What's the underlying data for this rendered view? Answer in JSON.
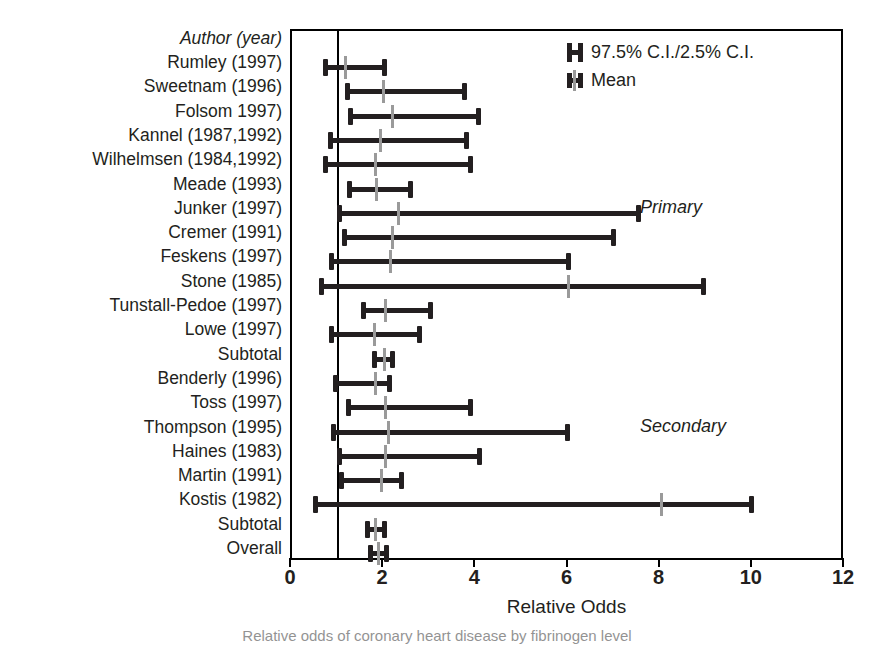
{
  "chart_data": {
    "type": "bar",
    "subtype": "forest-plot",
    "title": "",
    "xlabel": "Relative Odds",
    "ylabel": "",
    "xlim": [
      0,
      12
    ],
    "xticks": [
      0,
      2,
      4,
      6,
      8,
      10,
      12
    ],
    "grid": false,
    "reference_line": 1,
    "column_header": "Author (year)",
    "legend": {
      "position": "top-right",
      "entries": [
        {
          "glyph": "ci-ibar-icon",
          "label": "97.5% C.I./2.5% C.I."
        },
        {
          "glyph": "mean-ibar-icon",
          "label": "Mean"
        }
      ]
    },
    "section_notes": [
      {
        "label": "Primary",
        "row_index": 6
      },
      {
        "label": "Secondary",
        "row_index": 15
      }
    ],
    "rows": [
      {
        "label": "Rumley (1997)",
        "low": 0.71,
        "mean": 1.14,
        "high": 2.02,
        "kind": "study"
      },
      {
        "label": "Sweetnam (1996)",
        "low": 1.19,
        "mean": 1.97,
        "high": 3.75,
        "kind": "study"
      },
      {
        "label": "Folsom 1997)",
        "low": 1.25,
        "mean": 2.18,
        "high": 4.05,
        "kind": "study"
      },
      {
        "label": "Kannel (1987,1992)",
        "low": 0.82,
        "mean": 1.91,
        "high": 3.79,
        "kind": "study"
      },
      {
        "label": "Wilhelmsen (1984,1992)",
        "low": 0.72,
        "mean": 1.8,
        "high": 3.88,
        "kind": "study"
      },
      {
        "label": "Meade (1993)",
        "low": 1.23,
        "mean": 1.82,
        "high": 2.59,
        "kind": "study"
      },
      {
        "label": "Junker (1997)",
        "low": 1.03,
        "mean": 2.3,
        "high": 7.52,
        "kind": "study"
      },
      {
        "label": "Cremer (1991)",
        "low": 1.12,
        "mean": 2.18,
        "high": 6.98,
        "kind": "study"
      },
      {
        "label": "Feskens (1997)",
        "low": 0.85,
        "mean": 2.12,
        "high": 6.0,
        "kind": "study"
      },
      {
        "label": "Stone (1985)",
        "low": 0.63,
        "mean": 5.99,
        "high": 8.93,
        "kind": "study"
      },
      {
        "label": "Tunstall-Pedoe (1997)",
        "low": 1.53,
        "mean": 2.02,
        "high": 3.02,
        "kind": "study"
      },
      {
        "label": "Lowe (1997)",
        "low": 0.85,
        "mean": 1.79,
        "high": 2.78,
        "kind": "study"
      },
      {
        "label": "Subtotal",
        "low": 1.79,
        "mean": 1.99,
        "high": 2.19,
        "kind": "summary"
      },
      {
        "label": "Benderly (1996)",
        "low": 0.93,
        "mean": 1.8,
        "high": 2.13,
        "kind": "study"
      },
      {
        "label": "Toss (1997)",
        "low": 1.21,
        "mean": 2.01,
        "high": 3.88,
        "kind": "study"
      },
      {
        "label": "Thompson (1995)",
        "low": 0.9,
        "mean": 2.09,
        "high": 5.99,
        "kind": "study"
      },
      {
        "label": "Haines (1983)",
        "low": 1.03,
        "mean": 2.01,
        "high": 4.09,
        "kind": "study"
      },
      {
        "label": "Martin (1991)",
        "low": 1.07,
        "mean": 1.94,
        "high": 2.39,
        "kind": "study"
      },
      {
        "label": "Kostis (1982)",
        "low": 0.49,
        "mean": 8.0,
        "high": 9.98,
        "kind": "study"
      },
      {
        "label": "Subtotal",
        "low": 1.63,
        "mean": 1.81,
        "high": 2.01,
        "kind": "summary"
      },
      {
        "label": "Overall",
        "low": 1.7,
        "mean": 1.86,
        "high": 2.06,
        "kind": "summary"
      }
    ]
  },
  "colors": {
    "bar": "#231f20",
    "mean": "#9a9a9a",
    "axis": "#000000",
    "background": "#ffffff"
  },
  "caption": "Relative odds of coronary heart disease by fibrinogen level"
}
